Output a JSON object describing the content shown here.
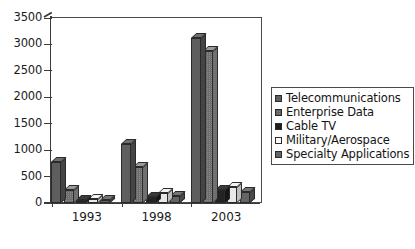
{
  "chart_data": {
    "type": "bar",
    "title": "",
    "subtitle": "",
    "xlabel": "",
    "ylabel": "",
    "categories": [
      "1993",
      "1998",
      "2003"
    ],
    "series": [
      {
        "name": "Telecommunications",
        "values": [
          780,
          1120,
          3120
        ],
        "swatch": "dark-gray"
      },
      {
        "name": "Enterprise Data",
        "values": [
          240,
          690,
          2870
        ],
        "swatch": "checkered-gray"
      },
      {
        "name": "Cable TV",
        "values": [
          50,
          110,
          250
        ],
        "swatch": "black"
      },
      {
        "name": "Military/Aerospace",
        "values": [
          80,
          180,
          300
        ],
        "swatch": "white"
      },
      {
        "name": "Specialty Applications",
        "values": [
          60,
          140,
          200
        ],
        "swatch": "medium-gray"
      }
    ],
    "ylim": [
      0,
      3500
    ],
    "yticks": [
      0,
      500,
      1000,
      1500,
      2000,
      2500,
      3000,
      3500
    ],
    "ytick_labels": [
      "0",
      "500",
      "1000",
      "1500",
      "2000",
      "2500",
      "3000",
      "3500"
    ],
    "grid": false,
    "legend_position": "right",
    "style_3d": true
  },
  "axes": {
    "y_labels": [
      "3500",
      "3000",
      "2500",
      "2000",
      "1500",
      "1000",
      "500",
      "0"
    ],
    "x_labels": [
      "1993",
      "1998",
      "2003"
    ]
  },
  "legend": {
    "entries": [
      {
        "label": "Telecommunications"
      },
      {
        "label": "Enterprise Data"
      },
      {
        "label": "Cable TV"
      },
      {
        "label": "Military/Aerospace"
      },
      {
        "label": "Specialty Applications"
      }
    ]
  },
  "colors": {
    "axis": "#3a3a3a",
    "frame": "#4a4a4a",
    "text": "#1b1b1b",
    "background": "#ffffff",
    "series": [
      "#5e5e5e",
      "#8c8c8c",
      "#232323",
      "#e8e8e8",
      "#646464"
    ]
  }
}
